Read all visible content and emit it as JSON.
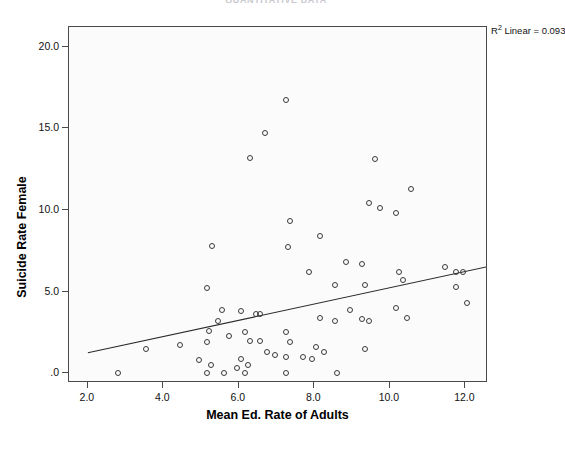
{
  "header": {
    "title": "QUANTITATIVE DATA"
  },
  "annotation": {
    "r2_prefix": "R",
    "r2_sup": "2",
    "r2_text": "Linear = 0.093"
  },
  "chart_data": {
    "type": "scatter",
    "title": "",
    "xlabel": "Mean Ed. Rate of Adults",
    "ylabel": "Suicide Rate Female",
    "xlim": [
      1.5,
      12.6
    ],
    "ylim": [
      -0.6,
      21.2
    ],
    "xticks": [
      2.0,
      4.0,
      6.0,
      8.0,
      10.0,
      12.0
    ],
    "xticklabels": [
      "2.0",
      "4.0",
      "6.0",
      "8.0",
      "10.0",
      "12.0"
    ],
    "yticks": [
      0.0,
      5.0,
      10.0,
      15.0,
      20.0
    ],
    "yticklabels": [
      ".0",
      "5.0",
      "10.0",
      "15.0",
      "20.0"
    ],
    "grid": false,
    "legend": false,
    "marker": "open-circle",
    "marker_color": "#3a3a3a",
    "plot_bg": "#fbfbfb",
    "fit": {
      "type": "linear",
      "r_squared": 0.093,
      "label": "R2 Linear = 0.093",
      "x_start": 2.0,
      "y_start": 1.25,
      "x_end": 13.45,
      "y_end": 6.95
    },
    "points": [
      {
        "x": 7.25,
        "y": 16.7
      },
      {
        "x": 6.7,
        "y": 14.7
      },
      {
        "x": 6.3,
        "y": 13.2
      },
      {
        "x": 9.6,
        "y": 13.1
      },
      {
        "x": 10.55,
        "y": 11.3
      },
      {
        "x": 9.45,
        "y": 10.4
      },
      {
        "x": 9.75,
        "y": 10.1
      },
      {
        "x": 10.15,
        "y": 9.8
      },
      {
        "x": 7.35,
        "y": 9.3
      },
      {
        "x": 8.15,
        "y": 8.4
      },
      {
        "x": 5.3,
        "y": 7.8
      },
      {
        "x": 7.3,
        "y": 7.7
      },
      {
        "x": 7.85,
        "y": 6.2
      },
      {
        "x": 8.85,
        "y": 6.8
      },
      {
        "x": 9.25,
        "y": 6.7
      },
      {
        "x": 10.25,
        "y": 6.2
      },
      {
        "x": 11.45,
        "y": 6.5
      },
      {
        "x": 11.75,
        "y": 6.2
      },
      {
        "x": 11.95,
        "y": 6.2
      },
      {
        "x": 9.35,
        "y": 5.4
      },
      {
        "x": 10.35,
        "y": 5.7
      },
      {
        "x": 11.75,
        "y": 5.3
      },
      {
        "x": 8.55,
        "y": 5.4
      },
      {
        "x": 5.15,
        "y": 5.2
      },
      {
        "x": 12.05,
        "y": 4.3
      },
      {
        "x": 10.15,
        "y": 4.0
      },
      {
        "x": 8.95,
        "y": 3.9
      },
      {
        "x": 5.55,
        "y": 3.9
      },
      {
        "x": 6.05,
        "y": 3.8
      },
      {
        "x": 6.45,
        "y": 3.6
      },
      {
        "x": 6.55,
        "y": 3.6
      },
      {
        "x": 5.45,
        "y": 3.2
      },
      {
        "x": 5.2,
        "y": 2.6
      },
      {
        "x": 5.75,
        "y": 2.3
      },
      {
        "x": 6.15,
        "y": 2.5
      },
      {
        "x": 7.25,
        "y": 2.5
      },
      {
        "x": 8.15,
        "y": 3.4
      },
      {
        "x": 8.55,
        "y": 3.2
      },
      {
        "x": 9.25,
        "y": 3.3
      },
      {
        "x": 9.45,
        "y": 3.2
      },
      {
        "x": 10.45,
        "y": 3.4
      },
      {
        "x": 7.35,
        "y": 1.9
      },
      {
        "x": 9.35,
        "y": 1.5
      },
      {
        "x": 6.55,
        "y": 2.0
      },
      {
        "x": 6.3,
        "y": 2.0
      },
      {
        "x": 5.15,
        "y": 1.9
      },
      {
        "x": 4.45,
        "y": 1.7
      },
      {
        "x": 3.55,
        "y": 1.5
      },
      {
        "x": 7.25,
        "y": 1.0
      },
      {
        "x": 8.05,
        "y": 1.6
      },
      {
        "x": 8.25,
        "y": 1.3
      },
      {
        "x": 7.95,
        "y": 0.9
      },
      {
        "x": 6.05,
        "y": 0.9
      },
      {
        "x": 6.25,
        "y": 0.5
      },
      {
        "x": 5.25,
        "y": 0.5
      },
      {
        "x": 5.95,
        "y": 0.3
      },
      {
        "x": 2.8,
        "y": 0.0
      },
      {
        "x": 5.15,
        "y": 0.0
      },
      {
        "x": 5.6,
        "y": 0.0
      },
      {
        "x": 6.15,
        "y": 0.0
      },
      {
        "x": 7.25,
        "y": 0.0
      },
      {
        "x": 8.6,
        "y": 0.0
      },
      {
        "x": 6.95,
        "y": 1.1
      },
      {
        "x": 7.7,
        "y": 1.0
      },
      {
        "x": 4.95,
        "y": 0.8
      },
      {
        "x": 6.75,
        "y": 1.3
      }
    ]
  }
}
